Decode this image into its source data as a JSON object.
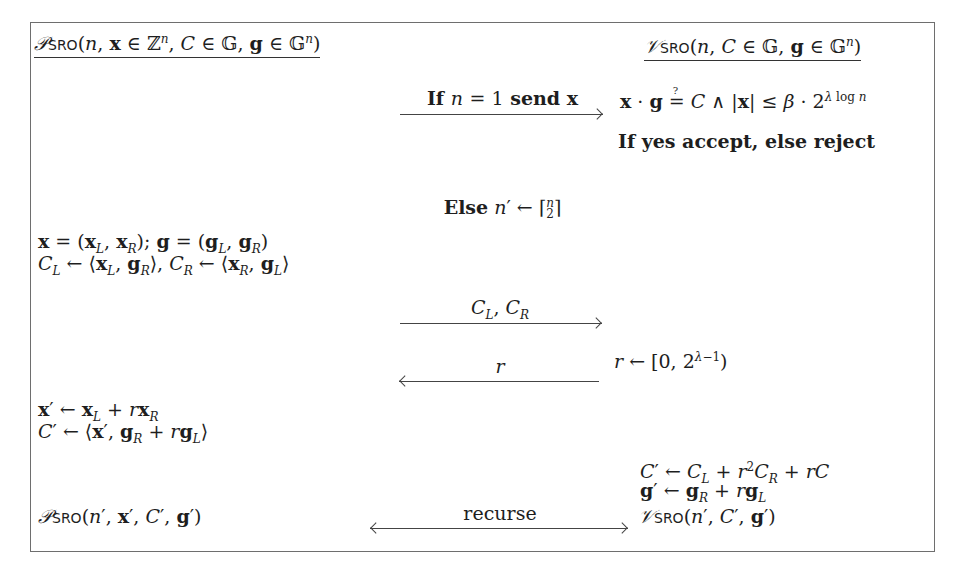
{
  "prover": {
    "header": "𝒫SRO(n, x ∈ ℤⁿ, C ∈ 𝔾, g ∈ 𝔾ⁿ)",
    "split": "x = (x_L, x_R); g = (g_L, g_R)",
    "cross_terms": "C_L ← ⟨x_L, g_R⟩, C_R ← ⟨x_R, g_L⟩",
    "fold_x": "x′ ← x_L + r x_R",
    "fold_C": "C′ ← ⟨x′, g_R + r g_L⟩",
    "recurse_call": "𝒫SRO(n′, x′, C′, g′)"
  },
  "verifier": {
    "header": "𝒱SRO(n, C ∈ 𝔾, g ∈ 𝔾ⁿ)",
    "check": "x · g ≟ C ∧ |x| ≤ β · 2^(λ log n)",
    "decision": "If yes accept, else reject",
    "challenge": "r ← [0, 2^(λ−1))",
    "fold_C": "C′ ← C_L + r² C_R + rC",
    "fold_g": "g′ ← g_R + r g_L",
    "recurse_call": "𝒱SRO(n′, C′, g′)"
  },
  "messages": [
    {
      "label": "If n = 1 send x",
      "direction": "prover-to-verifier"
    },
    {
      "label": "Else n′ ← ⌈n/2⌉",
      "direction": "none"
    },
    {
      "label": "C_L, C_R",
      "direction": "prover-to-verifier"
    },
    {
      "label": "r",
      "direction": "verifier-to-prover"
    },
    {
      "label": "recurse",
      "direction": "both"
    }
  ]
}
